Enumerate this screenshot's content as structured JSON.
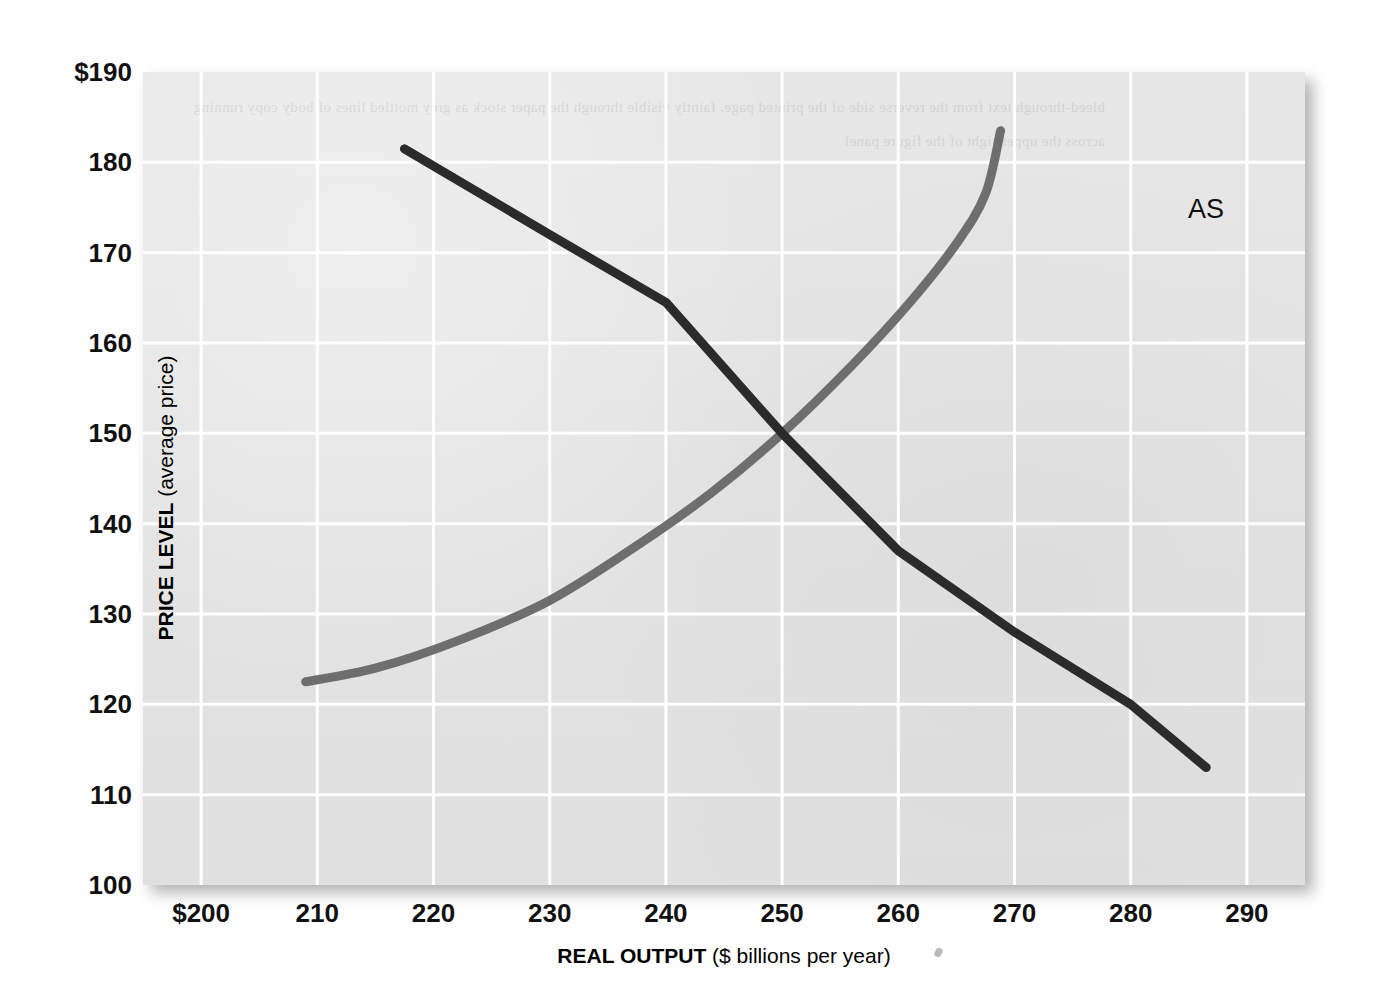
{
  "figure": {
    "background_color": "#ffffff",
    "plot_background_color": "#e4e4e4",
    "gridline_color": "#ffffff"
  },
  "axes": {
    "y": {
      "title_strong": "PRICE LEVEL",
      "title_rest": " (average price)",
      "ticks": [
        "$190",
        "180",
        "170",
        "160",
        "150",
        "140",
        "130",
        "120",
        "110",
        "100"
      ],
      "tick_values": [
        190,
        180,
        170,
        160,
        150,
        140,
        130,
        120,
        110,
        100
      ],
      "min": 100,
      "max": 190
    },
    "x": {
      "title_strong": "REAL OUTPUT",
      "title_rest": " ($ billions per year)",
      "ticks": [
        "$200",
        "210",
        "220",
        "230",
        "240",
        "250",
        "260",
        "270",
        "280",
        "290"
      ],
      "tick_values": [
        200,
        210,
        220,
        230,
        240,
        250,
        260,
        270,
        280,
        290
      ],
      "min": 195,
      "max": 295
    }
  },
  "annotations": {
    "as_label": "AS",
    "ad_label": "AD",
    "ad_subscript": "1"
  },
  "ghost_text": "bleed-through text from the reverse side of the printed page, faintly visible through the paper stock as grey mottled lines of body copy running across the upper right of the figure panel",
  "chart_data": {
    "type": "line",
    "title": "",
    "subtitle": "",
    "xlabel": "REAL OUTPUT ($ billions per year)",
    "ylabel": "PRICE LEVEL (average price)",
    "xlim": [
      195,
      295
    ],
    "ylim": [
      100,
      190
    ],
    "xticks": [
      200,
      210,
      220,
      230,
      240,
      250,
      260,
      270,
      280,
      290
    ],
    "yticks": [
      100,
      110,
      120,
      130,
      140,
      150,
      160,
      170,
      180,
      190
    ],
    "grid": true,
    "legend": "inline-curve-labels",
    "equilibrium": {
      "x": 250,
      "y": 150
    },
    "series": [
      {
        "name": "AD1",
        "label": "AD₁",
        "color": "#2b2b2b",
        "line_width": 9,
        "shape": "downward-sloping-straight",
        "points": [
          {
            "x": 217.5,
            "y": 181.5
          },
          {
            "x": 230.0,
            "y": 172.0
          },
          {
            "x": 240.0,
            "y": 164.5
          },
          {
            "x": 250.0,
            "y": 150.0
          },
          {
            "x": 260.0,
            "y": 137.0
          },
          {
            "x": 270.0,
            "y": 128.0
          },
          {
            "x": 280.0,
            "y": 120.0
          },
          {
            "x": 286.5,
            "y": 113.0
          }
        ]
      },
      {
        "name": "AS",
        "label": "AS",
        "color": "#6e6e6e",
        "line_width": 9,
        "shape": "upward-sloping-convex",
        "points": [
          {
            "x": 209.0,
            "y": 122.5
          },
          {
            "x": 215.0,
            "y": 124.0
          },
          {
            "x": 222.0,
            "y": 127.0
          },
          {
            "x": 230.0,
            "y": 131.5
          },
          {
            "x": 238.0,
            "y": 138.0
          },
          {
            "x": 244.0,
            "y": 143.5
          },
          {
            "x": 250.0,
            "y": 150.0
          },
          {
            "x": 256.0,
            "y": 157.5
          },
          {
            "x": 261.0,
            "y": 164.5
          },
          {
            "x": 265.0,
            "y": 171.0
          },
          {
            "x": 267.5,
            "y": 176.5
          },
          {
            "x": 268.8,
            "y": 183.5
          }
        ]
      }
    ]
  }
}
